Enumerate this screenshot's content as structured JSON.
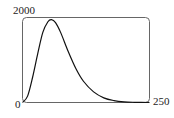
{
  "chart_data": {
    "type": "line",
    "title": "",
    "xlabel": "",
    "ylabel": "",
    "xlim": [
      0,
      250
    ],
    "ylim": [
      0,
      2000
    ],
    "x_tick_labels": [
      "0",
      "250"
    ],
    "y_tick_labels": [
      "2000"
    ],
    "grid": false,
    "legend": null,
    "series": [
      {
        "name": "curve",
        "x": [
          0,
          10,
          20,
          30,
          40,
          50,
          57,
          65,
          75,
          90,
          105,
          120,
          140,
          160,
          180,
          200,
          220,
          250
        ],
        "y": [
          0,
          150,
          600,
          1150,
          1650,
          1900,
          1950,
          1880,
          1650,
          1200,
          800,
          500,
          250,
          110,
          45,
          15,
          5,
          0
        ]
      }
    ]
  },
  "labels": {
    "y_max": "2000",
    "origin": "0",
    "x_max": "250"
  }
}
